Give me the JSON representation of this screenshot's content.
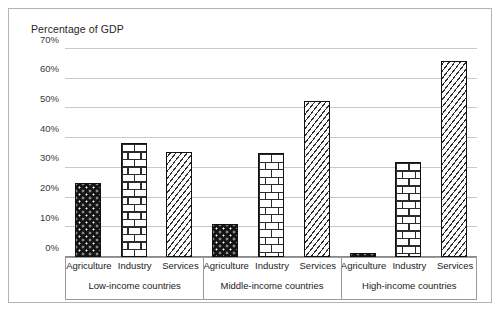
{
  "chart_data": {
    "type": "bar",
    "title": "Percentage of GDP",
    "xlabel": "",
    "ylabel": "",
    "ylim": [
      0,
      70
    ],
    "ytick_labels": [
      "0%",
      "10%",
      "20%",
      "30%",
      "40%",
      "50%",
      "60%",
      "70%"
    ],
    "ytick_values": [
      0,
      10,
      20,
      30,
      40,
      50,
      60,
      70
    ],
    "grid": true,
    "legend": "none",
    "categories": [
      "Agriculture",
      "Industry",
      "Services"
    ],
    "groups": [
      "Low-income countries",
      "Middle-income countries",
      "High-income countries"
    ],
    "series": [
      {
        "name": "Agriculture",
        "values": [
          25.0,
          11.0,
          1.5
        ],
        "pattern": "dotted-dark"
      },
      {
        "name": "Industry",
        "values": [
          38.5,
          35.0,
          32.0
        ],
        "pattern": "brick"
      },
      {
        "name": "Services",
        "values": [
          35.5,
          52.5,
          66.0
        ],
        "pattern": "diagonal-hatch"
      }
    ],
    "bars": [
      {
        "group": "Low-income countries",
        "category": "Agriculture",
        "value": 25.0,
        "pattern": "dotted-dark"
      },
      {
        "group": "Low-income countries",
        "category": "Industry",
        "value": 38.5,
        "pattern": "brick"
      },
      {
        "group": "Low-income countries",
        "category": "Services",
        "value": 35.5,
        "pattern": "diagonal-hatch"
      },
      {
        "group": "Middle-income countries",
        "category": "Agriculture",
        "value": 11.0,
        "pattern": "dotted-dark"
      },
      {
        "group": "Middle-income countries",
        "category": "Industry",
        "value": 35.0,
        "pattern": "brick"
      },
      {
        "group": "Middle-income countries",
        "category": "Services",
        "value": 52.5,
        "pattern": "diagonal-hatch"
      },
      {
        "group": "High-income countries",
        "category": "Agriculture",
        "value": 1.5,
        "pattern": "dotted-dark"
      },
      {
        "group": "High-income countries",
        "category": "Industry",
        "value": 32.0,
        "pattern": "brick"
      },
      {
        "group": "High-income countries",
        "category": "Services",
        "value": 66.0,
        "pattern": "diagonal-hatch"
      }
    ]
  },
  "colors": {
    "agriculture_fill": "#141414",
    "industry_fill": "#ffffff",
    "services_fill": "#fdfdfd",
    "bar_outline": "#111111",
    "gridline": "#c8c8c8",
    "frame": "#b4b4b4",
    "text": "#222222"
  }
}
